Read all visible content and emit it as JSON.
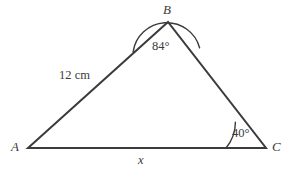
{
  "figure": {
    "kind": "geometry-diagram",
    "shape": "triangle",
    "background_color": "#ffffff",
    "stroke_color": "#3b3b3b",
    "text_color": "#3b3b3b",
    "stroke_width": 2,
    "arc_stroke_width": 1.4,
    "width": 289,
    "height": 169
  },
  "vertices": {
    "a": {
      "label": "A",
      "x": 28,
      "y": 148,
      "label_x": 11,
      "label_y": 140
    },
    "b": {
      "label": "B",
      "x": 168,
      "y": 22,
      "label_x": 163,
      "label_y": 3
    },
    "c": {
      "label": "C",
      "x": 266,
      "y": 148,
      "label_x": 272,
      "label_y": 140
    }
  },
  "sides": [
    {
      "name": "side-ab",
      "from": "A",
      "to": "B",
      "label": "12 cm",
      "value": 12,
      "unit": "cm",
      "label_x": 59,
      "label_y": 69
    },
    {
      "name": "side-ac",
      "from": "A",
      "to": "C",
      "label": "x",
      "value": null,
      "unit": "",
      "label_x": 138,
      "label_y": 154
    },
    {
      "name": "side-bc",
      "from": "B",
      "to": "C",
      "label": "",
      "value": null,
      "unit": ""
    }
  ],
  "angles": [
    {
      "name": "angle-b",
      "vertex": "B",
      "label": "84°",
      "value": 84,
      "unit": "degrees",
      "arc_radius": 34,
      "label_x": 152,
      "label_y": 40
    },
    {
      "name": "angle-c",
      "vertex": "C",
      "label": "40°",
      "value": 40,
      "unit": "degrees",
      "arc_radius": 40,
      "label_x": 232,
      "label_y": 127
    }
  ],
  "geometry_paths": {
    "triangle_path": "M 28 148 L 168 22 L 266 148 Z",
    "arc_b_path": "M 133.1 52.1 A 34 34 0 0 1 199.6 47.8",
    "arc_c_path": "M 226 148 A 40 40 0 0 0 235.4 122.3"
  }
}
